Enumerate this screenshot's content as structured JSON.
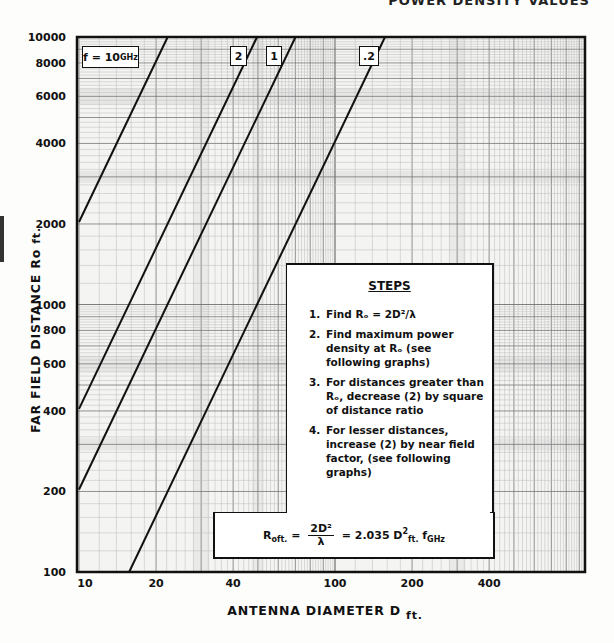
{
  "page": {
    "title_fragment": "POWER DENSITY VALUES"
  },
  "chart_data": {
    "type": "line",
    "xlabel": "ANTENNA DIAMETER D",
    "xlabel_unit": "ft.",
    "ylabel": "FAR FIELD DISTANCE Ro",
    "ylabel_unit": "ft.",
    "xscale": "log",
    "yscale": "log",
    "xlim": [
      10,
      950
    ],
    "ylim": [
      100,
      10000
    ],
    "grid": true,
    "x_ticks": [
      10,
      20,
      40,
      100,
      200,
      400
    ],
    "x_tick_labels": [
      "10",
      "20",
      "40",
      "100",
      "200",
      "400"
    ],
    "y_ticks": [
      100,
      200,
      400,
      600,
      800,
      1000,
      2000,
      4000,
      6000,
      8000,
      10000
    ],
    "y_tick_labels": [
      "100",
      "200",
      "400",
      "600",
      "800",
      "1000",
      "2000",
      "4000",
      "6000",
      "8000",
      "10000"
    ],
    "series": [
      {
        "name": "f = 10 GHz",
        "label": "f = 10GHz",
        "f_ghz": 10,
        "x": [
          10,
          22.2
        ],
        "y": [
          2035,
          10000
        ]
      },
      {
        "name": "2",
        "label": "2",
        "f_ghz": 2,
        "x": [
          10,
          49.6
        ],
        "y": [
          407,
          10000
        ]
      },
      {
        "name": "1",
        "label": "1",
        "f_ghz": 1,
        "x": [
          10,
          70.1
        ],
        "y": [
          203.5,
          10000
        ]
      },
      {
        "name": ".2",
        "label": ".2",
        "f_ghz": 0.2,
        "x": [
          15.7,
          156.8
        ],
        "y": [
          100,
          10000
        ]
      }
    ],
    "annotations": {
      "freq_box": {
        "prefix": "f = 10",
        "sub": "GHz"
      },
      "line_tags": [
        "2",
        "1",
        ".2"
      ]
    }
  },
  "steps": {
    "title": "STEPS",
    "items": [
      {
        "num": "1.",
        "text": "Find Rₒ = 2D²/λ"
      },
      {
        "num": "2.",
        "text": "Find maximum power density at Rₒ (see following graphs)"
      },
      {
        "num": "3.",
        "text": "For distances greater than Rₒ, decrease (2) by square of distance ratio"
      },
      {
        "num": "4.",
        "text": "For lesser distances, increase (2) by near field factor, (see following graphs)"
      }
    ]
  },
  "formula": {
    "lhs": "R",
    "lhs_sub": "oft.",
    "eq": "=",
    "num": "2D²",
    "den": "λ",
    "eq2": "=",
    "coef": "2.035 D",
    "coef_sup": "2",
    "coef_sub": "ft.",
    "f": "f",
    "f_sub": "GHz"
  }
}
